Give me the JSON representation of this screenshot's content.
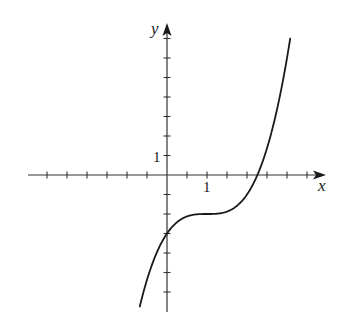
{
  "chart_data": {
    "type": "line",
    "title": "",
    "xlabel": "x",
    "ylabel": "y",
    "function": "y = (x - 1)^3 - 2",
    "xlim": [
      -3.5,
      4.0
    ],
    "ylim": [
      -7.0,
      7.8
    ],
    "x_ticks": [
      -3,
      -2.5,
      -2,
      -1.5,
      -1,
      -0.5,
      0.5,
      1,
      1.5,
      2,
      2.5,
      3,
      3.5
    ],
    "y_ticks": [
      -6,
      -5,
      -4,
      -3,
      -2,
      -1,
      1,
      2,
      3,
      4,
      5,
      6,
      7
    ],
    "x_tick_labels": [
      {
        "value": 1,
        "label": "1"
      }
    ],
    "y_tick_labels": [
      {
        "value": 1,
        "label": "1"
      }
    ],
    "grid": false,
    "legend": null,
    "series": [
      {
        "name": "f(x)",
        "x_range": [
          -0.68,
          3.08
        ],
        "key_points": [
          {
            "x": -0.68,
            "y": -6.74
          },
          {
            "x": 0,
            "y": -3
          },
          {
            "x": 0.5,
            "y": -2.125
          },
          {
            "x": 1,
            "y": -2
          },
          {
            "x": 1.5,
            "y": -1.875
          },
          {
            "x": 2,
            "y": -1
          },
          {
            "x": 2.26,
            "y": 0
          },
          {
            "x": 2.5,
            "y": 1.375
          },
          {
            "x": 3,
            "y": 6
          },
          {
            "x": 3.08,
            "y": 7.0
          }
        ]
      }
    ],
    "annotations": {
      "y_intercept": -3,
      "x_intercept": 2.26,
      "inflection_point": {
        "x": 1,
        "y": -2
      }
    }
  },
  "labels": {
    "x_axis": "x",
    "y_axis": "y",
    "x_one": "1",
    "y_one": "1"
  },
  "style": {
    "axis_color": "#333333",
    "curve_color": "#1a1a1a",
    "background": "#ffffff"
  }
}
